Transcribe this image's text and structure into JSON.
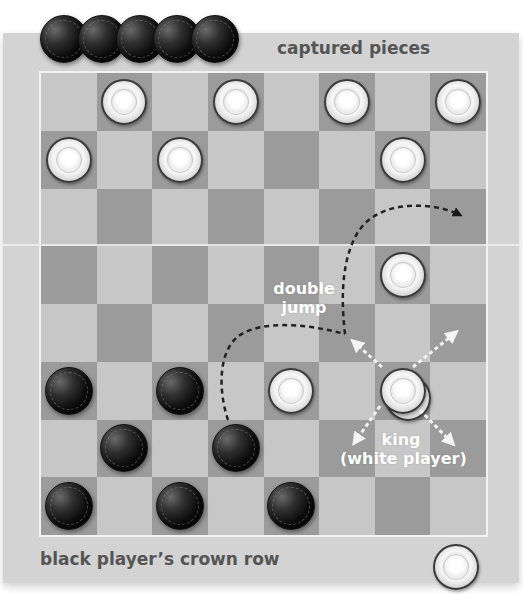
{
  "labels": {
    "captured": "captured pieces",
    "crown_row": "black player’s crown row",
    "double_jump_line1": "double",
    "double_jump_line2": "jump",
    "king_line1": "king",
    "king_line2": "(white player)"
  },
  "colors": {
    "panel": "#d3d3d3",
    "light_square": "#c7c7c7",
    "dark_square": "#9b9b9b",
    "label_text": "#555555",
    "annotation_text": "#ffffff",
    "jump_path": "#222222",
    "king_arrows": "#f2f2f2"
  },
  "board": {
    "rows": 8,
    "cols": 8,
    "dark_when": "row+col odd",
    "pieces": [
      {
        "row": 0,
        "col": 1,
        "color": "white"
      },
      {
        "row": 0,
        "col": 3,
        "color": "white"
      },
      {
        "row": 0,
        "col": 5,
        "color": "white"
      },
      {
        "row": 0,
        "col": 7,
        "color": "white"
      },
      {
        "row": 1,
        "col": 0,
        "color": "white"
      },
      {
        "row": 1,
        "col": 2,
        "color": "white"
      },
      {
        "row": 1,
        "col": 6,
        "color": "white"
      },
      {
        "row": 3,
        "col": 6,
        "color": "white"
      },
      {
        "row": 5,
        "col": 0,
        "color": "black"
      },
      {
        "row": 5,
        "col": 2,
        "color": "black"
      },
      {
        "row": 5,
        "col": 4,
        "color": "white"
      },
      {
        "row": 5,
        "col": 6,
        "color": "white",
        "king": true
      },
      {
        "row": 6,
        "col": 1,
        "color": "black"
      },
      {
        "row": 6,
        "col": 3,
        "color": "black"
      },
      {
        "row": 7,
        "col": 0,
        "color": "black"
      },
      {
        "row": 7,
        "col": 2,
        "color": "black"
      },
      {
        "row": 7,
        "col": 4,
        "color": "black"
      }
    ]
  },
  "captured_pieces": {
    "color": "black",
    "count": 5
  },
  "spare_piece": {
    "color": "white",
    "location": "below board, right"
  },
  "annotations": {
    "double_jump_path": {
      "from": {
        "row": 6,
        "col": 3
      },
      "via": {
        "row": 4,
        "col": 5
      },
      "to": {
        "row": 2,
        "col": 7
      }
    },
    "king_moves": [
      "up-left",
      "up-right",
      "down-left",
      "down-right"
    ]
  }
}
